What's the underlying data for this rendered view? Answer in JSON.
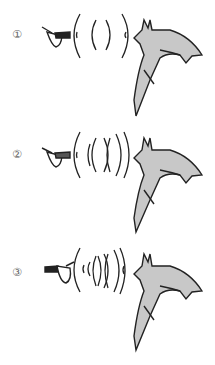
{
  "panels": [
    {
      "label": "①",
      "description": "Moth far from bat; echolocation pulses widely spaced",
      "wave_count": 4
    },
    {
      "label": "②",
      "description": "Moth closer; pulses more frequent",
      "wave_count": 6
    },
    {
      "label": "③",
      "description": "Moth very close; pulses rapid (feeding buzz)",
      "wave_count": 8
    }
  ],
  "colors": {
    "bat_fill": "#c8c8c8",
    "outline": "#222222",
    "label": "#666666"
  }
}
